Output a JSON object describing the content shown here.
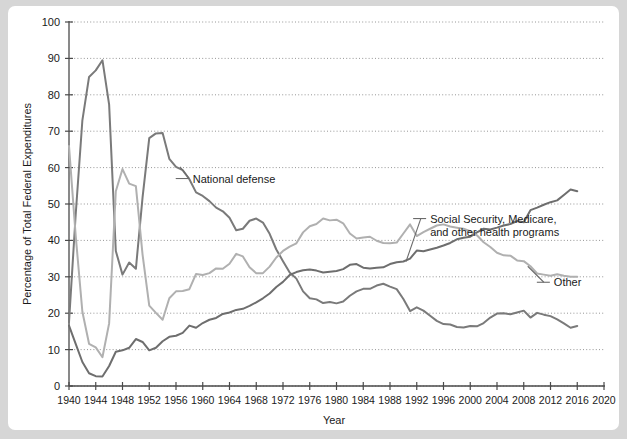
{
  "chart_data": {
    "type": "line",
    "title": "",
    "xlabel": "Year",
    "ylabel": "Percentage of Total Federal Expenditures",
    "xlim": [
      1940,
      2020
    ],
    "ylim": [
      0,
      100
    ],
    "xticks": [
      1940,
      1944,
      1948,
      1952,
      1956,
      1960,
      1964,
      1968,
      1972,
      1976,
      1980,
      1984,
      1988,
      1992,
      1996,
      2000,
      2004,
      2008,
      2012,
      2016,
      2020
    ],
    "yticks": [
      0,
      10,
      20,
      30,
      40,
      50,
      60,
      70,
      80,
      90,
      100
    ],
    "grid": "horizontal-dotted",
    "legend": "inline-annotations",
    "x": [
      1940,
      1941,
      1942,
      1943,
      1944,
      1945,
      1946,
      1947,
      1948,
      1949,
      1950,
      1951,
      1952,
      1953,
      1954,
      1955,
      1956,
      1957,
      1958,
      1959,
      1960,
      1961,
      1962,
      1963,
      1964,
      1965,
      1966,
      1967,
      1968,
      1969,
      1970,
      1971,
      1972,
      1973,
      1974,
      1975,
      1976,
      1977,
      1978,
      1979,
      1980,
      1981,
      1982,
      1983,
      1984,
      1985,
      1986,
      1987,
      1988,
      1989,
      1990,
      1991,
      1992,
      1993,
      1994,
      1995,
      1996,
      1997,
      1998,
      1999,
      2000,
      2001,
      2002,
      2003,
      2004,
      2005,
      2006,
      2007,
      2008,
      2009,
      2010,
      2011,
      2012,
      2013,
      2014,
      2015,
      2016
    ],
    "series": [
      {
        "name": "National defense",
        "color": "#7a7a7a",
        "label_text": "National defense",
        "label_x": 1958.5,
        "label_y": 57.0,
        "values": [
          17.5,
          47.1,
          73.0,
          84.9,
          86.7,
          89.5,
          77.3,
          37.1,
          30.6,
          33.9,
          32.2,
          51.8,
          68.1,
          69.4,
          69.5,
          62.4,
          60.2,
          59.3,
          56.8,
          53.2,
          52.2,
          50.8,
          49.0,
          48.0,
          46.2,
          42.8,
          43.2,
          45.4,
          46.0,
          44.9,
          41.8,
          37.5,
          34.3,
          31.2,
          29.5,
          26.0,
          24.1,
          23.8,
          22.8,
          23.1,
          22.7,
          23.2,
          24.8,
          26.0,
          26.7,
          26.7,
          27.6,
          28.1,
          27.3,
          26.6,
          23.9,
          20.6,
          21.6,
          20.7,
          19.3,
          17.9,
          17.0,
          16.9,
          16.2,
          16.1,
          16.5,
          16.4,
          17.3,
          18.8,
          19.9,
          20.0,
          19.7,
          20.2,
          20.7,
          18.8,
          20.1,
          19.6,
          19.2,
          18.3,
          17.2,
          16.0,
          16.5
        ]
      },
      {
        "name": "Social Security, Medicare, and other health programs",
        "color": "#6e6e6e",
        "label_text": "Social Security, Medicare,|and other health programs",
        "label_x": 1994.0,
        "label_y": 46.0,
        "values": [
          16.6,
          11.6,
          6.6,
          3.5,
          2.7,
          2.6,
          5.5,
          9.4,
          9.8,
          10.5,
          12.9,
          12.1,
          9.8,
          10.5,
          12.3,
          13.5,
          13.8,
          14.6,
          16.6,
          16.0,
          17.3,
          18.2,
          18.7,
          19.8,
          20.2,
          20.9,
          21.2,
          22.0,
          23.0,
          24.1,
          25.4,
          27.2,
          28.6,
          30.5,
          31.3,
          31.8,
          32.0,
          31.7,
          31.2,
          31.4,
          31.6,
          32.1,
          33.3,
          33.5,
          32.5,
          32.3,
          32.5,
          32.6,
          33.5,
          34.0,
          34.2,
          35.0,
          37.2,
          37.0,
          37.5,
          38.0,
          38.6,
          39.3,
          40.3,
          40.7,
          41.0,
          42.2,
          43.2,
          43.0,
          43.5,
          44.1,
          44.5,
          45.3,
          45.0,
          48.3,
          49.0,
          49.8,
          50.5,
          51.0,
          52.5,
          54.0,
          53.5
        ]
      },
      {
        "name": "Other",
        "color": "#b0b0b0",
        "label_text": "Other",
        "label_x": 2012.5,
        "label_y": 28.5,
        "values": [
          65.9,
          41.3,
          20.4,
          11.6,
          10.6,
          7.9,
          17.2,
          53.5,
          59.6,
          55.6,
          54.9,
          36.1,
          22.1,
          20.1,
          18.2,
          24.1,
          26.0,
          26.1,
          26.6,
          30.8,
          30.5,
          31.0,
          32.3,
          32.2,
          33.6,
          36.3,
          35.6,
          32.6,
          31.0,
          31.0,
          32.8,
          35.3,
          37.1,
          38.3,
          39.2,
          42.2,
          43.9,
          44.5,
          46.0,
          45.5,
          45.7,
          44.7,
          41.9,
          40.5,
          40.8,
          41.0,
          39.9,
          39.3,
          39.2,
          39.4,
          41.9,
          44.4,
          41.2,
          42.3,
          43.2,
          44.1,
          44.4,
          43.8,
          43.5,
          43.2,
          42.5,
          41.4,
          39.5,
          38.2,
          36.6,
          35.9,
          35.8,
          34.5,
          34.3,
          32.9,
          30.9,
          30.6,
          30.3,
          30.7,
          30.3,
          30.0,
          30.0
        ]
      }
    ]
  }
}
